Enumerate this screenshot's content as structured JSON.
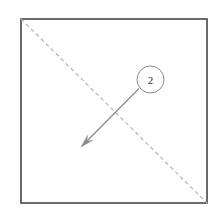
{
  "diagram": {
    "canvas": {
      "width": 221,
      "height": 212,
      "background": "#ffffff"
    },
    "sheet": {
      "name": "paper square",
      "x": 21,
      "y": 19,
      "width": 186,
      "height": 184,
      "stroke_color": "#3a3a3a",
      "stroke_width": 1.5,
      "fill_color": "#ffffff"
    },
    "crease": {
      "name": "valley fold crease",
      "style": "dashed",
      "x1": 21,
      "y1": 19,
      "x2": 207,
      "y2": 203,
      "stroke_color": "#b3b3b3",
      "stroke_width": 1.2,
      "dash_pattern": "4 3"
    },
    "callout": {
      "name": "step number callout",
      "label": "2",
      "cx": 150.5,
      "cy": 79.5,
      "r": 13.5,
      "stroke_color": "#8a8a8a",
      "stroke_width": 1,
      "fill_color": "#ffffff",
      "text_color": "#2b2b2b"
    },
    "leader": {
      "name": "fold direction arrow",
      "from_x": 139,
      "from_y": 88.5,
      "to_x": 85,
      "to_y": 143,
      "tip_x": 81,
      "tip_y": 147,
      "stroke_color": "#8a8a8a",
      "stroke_width": 1.2,
      "arrowhead_color": "#8a8a8a",
      "arrowhead_length": 13,
      "arrowhead_width": 7
    }
  }
}
